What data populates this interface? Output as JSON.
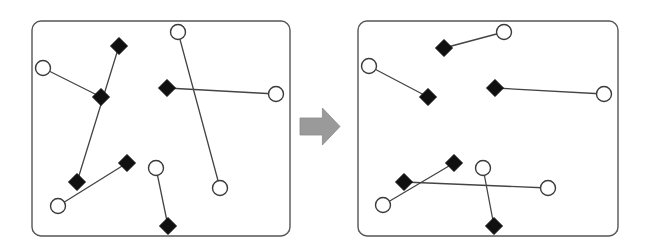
{
  "figure": {
    "background_color": "#ffffff",
    "width": 647,
    "height": 252,
    "panel_stroke_color": "#555555",
    "edge_color": "#444444",
    "circle_fill": "#ffffff",
    "circle_stroke": "#3a3a3a",
    "diamond_fill": "#101010",
    "arrow_color": "#9a9a9a",
    "node_radius": 7.5,
    "diamond_radius": 8.5
  },
  "panels": [
    {
      "id": "left-panel",
      "label": "Matching with crossings",
      "frame": {
        "x": 32,
        "y": 21,
        "width": 258,
        "height": 215,
        "rx": 9
      },
      "nodes": [
        {
          "id": "L-c1",
          "type": "circle",
          "label": "circle-1",
          "x": 43,
          "y": 68
        },
        {
          "id": "L-c2",
          "type": "circle",
          "label": "circle-2",
          "x": 178,
          "y": 32
        },
        {
          "id": "L-c3",
          "type": "circle",
          "label": "circle-3",
          "x": 276,
          "y": 94
        },
        {
          "id": "L-c4",
          "type": "circle",
          "label": "circle-4",
          "x": 58,
          "y": 206
        },
        {
          "id": "L-c5",
          "type": "circle",
          "label": "circle-5",
          "x": 156,
          "y": 168
        },
        {
          "id": "L-c6",
          "type": "circle",
          "label": "circle-6",
          "x": 220,
          "y": 188
        },
        {
          "id": "L-d1",
          "type": "diamond",
          "label": "diamond-1",
          "x": 119,
          "y": 46
        },
        {
          "id": "L-d2",
          "type": "diamond",
          "label": "diamond-2",
          "x": 101,
          "y": 97
        },
        {
          "id": "L-d3",
          "type": "diamond",
          "label": "diamond-3",
          "x": 167,
          "y": 88
        },
        {
          "id": "L-d4",
          "type": "diamond",
          "label": "diamond-4",
          "x": 77,
          "y": 182
        },
        {
          "id": "L-d5",
          "type": "diamond",
          "label": "diamond-5",
          "x": 127,
          "y": 163
        },
        {
          "id": "L-d6",
          "type": "diamond",
          "label": "diamond-6",
          "x": 168,
          "y": 226
        }
      ],
      "edges": [
        {
          "id": "L-e1",
          "from": "L-c1",
          "to": "L-d2",
          "crossing": false
        },
        {
          "id": "L-e2",
          "from": "L-c2",
          "to": "L-c6",
          "crossing": true
        },
        {
          "id": "L-e3",
          "from": "L-d1",
          "to": "L-d4",
          "crossing": true
        },
        {
          "id": "L-e4",
          "from": "L-d3",
          "to": "L-c3",
          "crossing": false
        },
        {
          "id": "L-e5",
          "from": "L-c4",
          "to": "L-d5",
          "crossing": false
        },
        {
          "id": "L-e6",
          "from": "L-c5",
          "to": "L-d6",
          "crossing": false
        }
      ]
    },
    {
      "id": "right-panel",
      "label": "Matching without crossings",
      "frame": {
        "x": 358,
        "y": 21,
        "width": 260,
        "height": 215,
        "rx": 9
      },
      "nodes": [
        {
          "id": "R-c1",
          "type": "circle",
          "label": "circle-1",
          "x": 369,
          "y": 66
        },
        {
          "id": "R-c2",
          "type": "circle",
          "label": "circle-2",
          "x": 504,
          "y": 32
        },
        {
          "id": "R-c3",
          "type": "circle",
          "label": "circle-3",
          "x": 604,
          "y": 94
        },
        {
          "id": "R-c4",
          "type": "circle",
          "label": "circle-4",
          "x": 383,
          "y": 205
        },
        {
          "id": "R-c5",
          "type": "circle",
          "label": "circle-5",
          "x": 483,
          "y": 168
        },
        {
          "id": "R-c6",
          "type": "circle",
          "label": "circle-6",
          "x": 548,
          "y": 188
        },
        {
          "id": "R-d1",
          "type": "diamond",
          "label": "diamond-1",
          "x": 444,
          "y": 48
        },
        {
          "id": "R-d2",
          "type": "diamond",
          "label": "diamond-2",
          "x": 428,
          "y": 97
        },
        {
          "id": "R-d3",
          "type": "diamond",
          "label": "diamond-3",
          "x": 495,
          "y": 88
        },
        {
          "id": "R-d4",
          "type": "diamond",
          "label": "diamond-4",
          "x": 404,
          "y": 182
        },
        {
          "id": "R-d5",
          "type": "diamond",
          "label": "diamond-5",
          "x": 454,
          "y": 163
        },
        {
          "id": "R-d6",
          "type": "diamond",
          "label": "diamond-6",
          "x": 494,
          "y": 226
        }
      ],
      "edges": [
        {
          "id": "R-e1",
          "from": "R-c1",
          "to": "R-d2",
          "crossing": false
        },
        {
          "id": "R-e2",
          "from": "R-c2",
          "to": "R-d1",
          "crossing": false
        },
        {
          "id": "R-e3",
          "from": "R-d3",
          "to": "R-c3",
          "crossing": false
        },
        {
          "id": "R-e4",
          "from": "R-c4",
          "to": "R-d5",
          "crossing": false
        },
        {
          "id": "R-e5",
          "from": "R-d4",
          "to": "R-c6",
          "crossing": false
        },
        {
          "id": "R-e6",
          "from": "R-c5",
          "to": "R-d6",
          "crossing": false
        }
      ]
    }
  ],
  "arrow": {
    "id": "transition-arrow",
    "label": "right-arrow-icon",
    "color": "#9a9a9a",
    "x": 300,
    "y": 108,
    "width": 40,
    "height": 37
  }
}
